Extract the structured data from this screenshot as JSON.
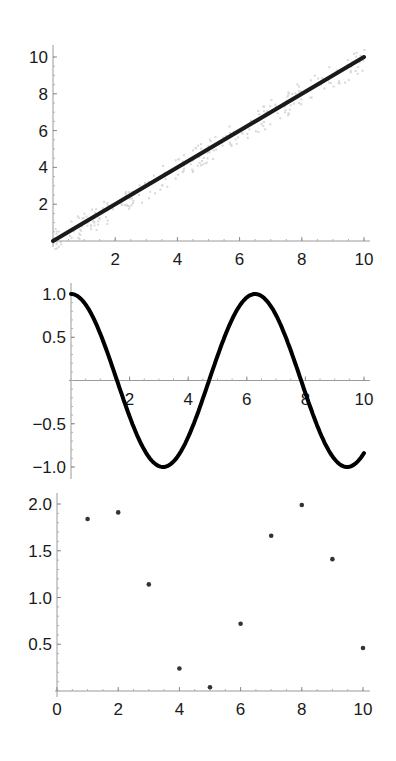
{
  "chart_data": [
    {
      "id": "linear",
      "type": "line",
      "title": "",
      "xlabel": "",
      "ylabel": "",
      "xlim": [
        0,
        10
      ],
      "ylim": [
        0,
        10
      ],
      "x_ticks": [
        2,
        4,
        6,
        8,
        10
      ],
      "y_ticks": [
        2,
        4,
        6,
        8,
        10
      ],
      "x_tick_labels": [
        "2",
        "4",
        "6",
        "8",
        "10"
      ],
      "y_tick_labels": [
        "2",
        "4",
        "6",
        "8",
        "10"
      ],
      "grid": false,
      "series": [
        {
          "name": "y = x",
          "x": [
            0,
            10
          ],
          "y": [
            0,
            10
          ],
          "color": "#1a1a1a"
        }
      ],
      "background_noise": "faint gray scatter around y = x"
    },
    {
      "id": "cosine",
      "type": "line",
      "title": "",
      "xlabel": "",
      "ylabel": "",
      "xlim": [
        0,
        10
      ],
      "ylim": [
        -1,
        1
      ],
      "x_ticks": [
        2,
        4,
        6,
        8,
        10
      ],
      "y_ticks": [
        1.0,
        0.5,
        -0.5,
        -1.0
      ],
      "x_tick_labels": [
        "2",
        "4",
        "6",
        "8",
        "10"
      ],
      "y_tick_labels": [
        "1.0",
        "0.5",
        "−0.5",
        "−1.0"
      ],
      "grid": false,
      "series": [
        {
          "name": "cos(x)",
          "x": [
            0,
            0.5,
            1,
            1.5,
            2,
            2.5,
            3,
            3.5,
            4,
            4.5,
            5,
            5.5,
            6,
            6.5,
            7,
            7.5,
            8,
            8.5,
            9,
            9.5,
            10
          ],
          "y": [
            1.0,
            0.878,
            0.54,
            0.071,
            -0.416,
            -0.801,
            -0.99,
            -0.936,
            -0.654,
            -0.211,
            0.284,
            0.709,
            0.96,
            0.977,
            0.754,
            0.347,
            -0.146,
            -0.602,
            -0.911,
            -0.997,
            -0.839
          ],
          "color": "#000000"
        }
      ]
    },
    {
      "id": "points",
      "type": "scatter",
      "title": "",
      "xlabel": "",
      "ylabel": "",
      "xlim": [
        0,
        10
      ],
      "ylim": [
        0,
        2
      ],
      "x_ticks": [
        0,
        2,
        4,
        6,
        8,
        10
      ],
      "y_ticks": [
        0.5,
        1.0,
        1.5,
        2.0
      ],
      "x_tick_labels": [
        "0",
        "2",
        "4",
        "6",
        "8",
        "10"
      ],
      "y_tick_labels": [
        "0.5",
        "1.0",
        "1.5",
        "2.0"
      ],
      "grid": false,
      "series": [
        {
          "name": "1 + sin(n)",
          "x": [
            1,
            2,
            3,
            4,
            5,
            6,
            7,
            8,
            9,
            10
          ],
          "y": [
            1.84,
            1.91,
            1.14,
            0.24,
            0.04,
            0.72,
            1.66,
            1.99,
            1.41,
            0.46
          ],
          "color": "#333333"
        }
      ]
    }
  ]
}
